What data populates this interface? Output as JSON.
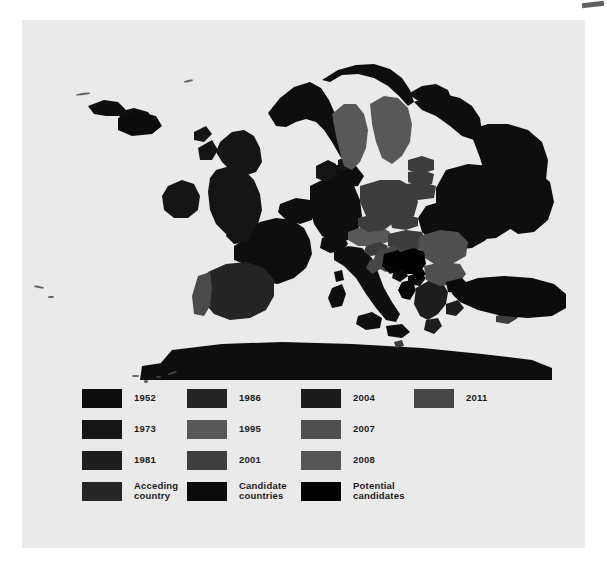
{
  "figure": {
    "background_color": "#ebebeb",
    "page_background": "#ffffff"
  },
  "map": {
    "title": "European Union enlargement map",
    "sea_color": "#ebebeb",
    "regions": [
      {
        "name": "Ireland",
        "year": "1973",
        "color": "#141414"
      },
      {
        "name": "United Kingdom",
        "year": "1973",
        "color": "#141414"
      },
      {
        "name": "Portugal",
        "year": "1986",
        "color": "#4a4a4a"
      },
      {
        "name": "Spain",
        "year": "1986",
        "color": "#232323"
      },
      {
        "name": "France",
        "year": "1952",
        "color": "#0d0d0d"
      },
      {
        "name": "Belgium",
        "year": "1952",
        "color": "#0d0d0d"
      },
      {
        "name": "Netherlands",
        "year": "1952",
        "color": "#0d0d0d"
      },
      {
        "name": "Luxembourg",
        "year": "1952",
        "color": "#0d0d0d"
      },
      {
        "name": "Germany",
        "year": "1952",
        "color": "#0d0d0d"
      },
      {
        "name": "Italy",
        "year": "1952",
        "color": "#0d0d0d"
      },
      {
        "name": "Denmark",
        "year": "1973",
        "color": "#141414"
      },
      {
        "name": "Greece",
        "year": "1981",
        "color": "#1c1c1c"
      },
      {
        "name": "Austria",
        "year": "1995",
        "color": "#585858"
      },
      {
        "name": "Sweden",
        "year": "1995",
        "color": "#585858"
      },
      {
        "name": "Finland",
        "year": "1995",
        "color": "#585858"
      },
      {
        "name": "Poland",
        "year": "2004",
        "color": "#3c3c3c"
      },
      {
        "name": "Czech Republic",
        "year": "2004",
        "color": "#3c3c3c"
      },
      {
        "name": "Slovakia",
        "year": "2004",
        "color": "#3c3c3c"
      },
      {
        "name": "Hungary",
        "year": "2004",
        "color": "#3c3c3c"
      },
      {
        "name": "Slovenia",
        "year": "2004",
        "color": "#3c3c3c"
      },
      {
        "name": "Estonia",
        "year": "2004",
        "color": "#3c3c3c"
      },
      {
        "name": "Latvia",
        "year": "2004",
        "color": "#3c3c3c"
      },
      {
        "name": "Lithuania",
        "year": "2004",
        "color": "#3c3c3c"
      },
      {
        "name": "Cyprus",
        "year": "2004",
        "color": "#3c3c3c"
      },
      {
        "name": "Malta",
        "year": "2004",
        "color": "#3c3c3c"
      },
      {
        "name": "Romania",
        "year": "2007",
        "color": "#4f4f4f"
      },
      {
        "name": "Bulgaria",
        "year": "2007",
        "color": "#4f4f4f"
      },
      {
        "name": "Croatia",
        "year": "2011",
        "color": "#464646"
      },
      {
        "name": "Turkey",
        "year": "Candidate countries",
        "color": "#0a0a0a"
      },
      {
        "name": "Macedonia",
        "year": "Candidate countries",
        "color": "#0a0a0a"
      },
      {
        "name": "Montenegro",
        "year": "Candidate countries",
        "color": "#0a0a0a"
      },
      {
        "name": "Iceland",
        "year": "Candidate countries",
        "color": "#0a0a0a"
      },
      {
        "name": "Serbia",
        "year": "Potential candidates",
        "color": "#000000"
      },
      {
        "name": "Bosnia and Herzegovina",
        "year": "Potential candidates",
        "color": "#000000"
      },
      {
        "name": "Albania",
        "year": "Potential candidates",
        "color": "#000000"
      },
      {
        "name": "Kosovo",
        "year": "Potential candidates",
        "color": "#000000"
      },
      {
        "name": "Norway",
        "year": "non-member",
        "color": "#0d0d0d"
      },
      {
        "name": "Switzerland",
        "year": "non-member",
        "color": "#0d0d0d"
      },
      {
        "name": "Ukraine",
        "year": "non-member",
        "color": "#0d0d0d"
      },
      {
        "name": "Belarus",
        "year": "non-member",
        "color": "#0d0d0d"
      },
      {
        "name": "Russia",
        "year": "non-member",
        "color": "#0d0d0d"
      },
      {
        "name": "Moldova",
        "year": "non-member",
        "color": "#0d0d0d"
      },
      {
        "name": "North Africa",
        "year": "non-member",
        "color": "#0d0d0d"
      }
    ]
  },
  "legend": {
    "columns": [
      {
        "entries": [
          {
            "label": "1952",
            "color": "#0d0d0d"
          },
          {
            "label": "1973",
            "color": "#141414"
          },
          {
            "label": "1981",
            "color": "#1c1c1c"
          },
          {
            "label": "Acceding\ncountry",
            "color": "#252525"
          }
        ]
      },
      {
        "entries": [
          {
            "label": "1986",
            "color": "#232323"
          },
          {
            "label": "1995",
            "color": "#585858"
          },
          {
            "label": "2001",
            "color": "#3e3e3e"
          },
          {
            "label": "Candidate\ncountries",
            "color": "#0a0a0a"
          }
        ]
      },
      {
        "entries": [
          {
            "label": "2004",
            "color": "#1a1a1a"
          },
          {
            "label": "2007",
            "color": "#4f4f4f"
          },
          {
            "label": "2008",
            "color": "#555555"
          },
          {
            "label": "Potential\ncandidates",
            "color": "#000000"
          }
        ]
      },
      {
        "entries": [
          {
            "label": "2011",
            "color": "#464646"
          }
        ]
      }
    ]
  }
}
